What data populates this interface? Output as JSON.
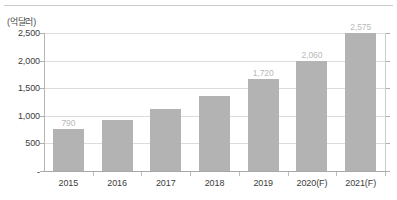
{
  "chart_data": {
    "type": "bar",
    "title": "",
    "subtitle": "",
    "unit_caption": "(억달러)",
    "xlabel": "",
    "ylabel": "",
    "categories": [
      "2015",
      "2016",
      "2017",
      "2018",
      "2019",
      "2020(F)",
      "2021(F)"
    ],
    "values": [
      790,
      950,
      1160,
      1400,
      1720,
      2060,
      2575
    ],
    "data_labels": [
      "790",
      "",
      "",
      "",
      "1,720",
      "2,060",
      "2,575"
    ],
    "ylim": [
      0,
      2575
    ],
    "yticks": [
      0,
      500,
      1000,
      1500,
      2000,
      2500
    ],
    "ytick_labels": [
      "-",
      "500",
      "1,000",
      "1,500",
      "2,000",
      "2,500"
    ],
    "grid": true,
    "legend": false,
    "legend_position": "none",
    "bar_color": "#b3b3b3",
    "gridline_color": "#dcdcdc",
    "label_color": "#b9b9b9",
    "axis_text_color": "#3c3c3c"
  }
}
